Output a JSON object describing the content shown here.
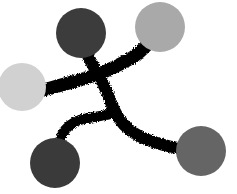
{
  "diagram": {
    "nodes": [
      {
        "id": "node-top",
        "shade": "dark",
        "color": "#3c3c3c"
      },
      {
        "id": "node-top-right",
        "shade": "light",
        "color": "#a9a9a9"
      },
      {
        "id": "node-left",
        "shade": "very-light",
        "color": "#d1d1d1"
      },
      {
        "id": "node-bottom-left",
        "shade": "dark",
        "color": "#3a3a3a"
      },
      {
        "id": "node-bottom-right",
        "shade": "medium",
        "color": "#656565"
      }
    ],
    "edges": [
      {
        "from": "node-left",
        "to": "node-top-right"
      },
      {
        "from": "node-top",
        "to": "node-bottom-right"
      },
      {
        "from": "node-bottom-left",
        "to": "node-top-to-bottom-right-edge"
      }
    ],
    "stroke_color": "#000000",
    "background": "#ffffff"
  }
}
